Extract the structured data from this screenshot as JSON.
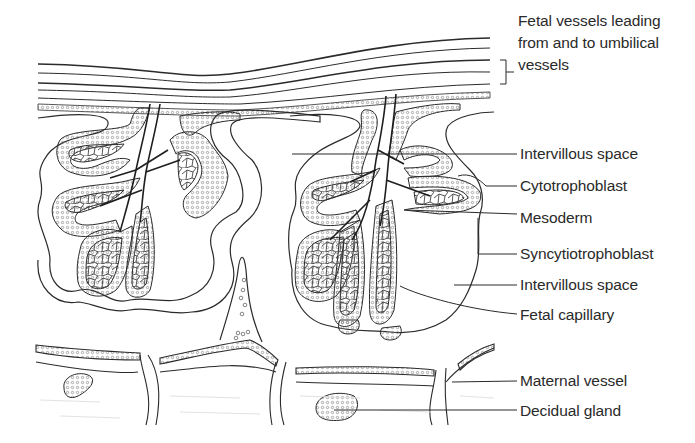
{
  "figure": {
    "title": ""
  },
  "labels": {
    "fetal_vessels": "Fetal vessels leading from and to umbilical vessels",
    "intervillous_space_upper": "Intervillous space",
    "cytotrophoblast": "Cytotrophoblast",
    "mesoderm": "Mesoderm",
    "syncytiotrophoblast": "Syncytiotrophoblast",
    "intervillous_space_lower": "Intervillous space",
    "fetal_capillary": "Fetal capillary",
    "maternal_vessel": "Maternal vessel",
    "decidual_gland": "Decidual gland"
  },
  "colors": {
    "line": "#2b2b2b",
    "stipple": "#8a8a8a",
    "background": "#ffffff",
    "decidua_shade": "#f3f3f3"
  }
}
